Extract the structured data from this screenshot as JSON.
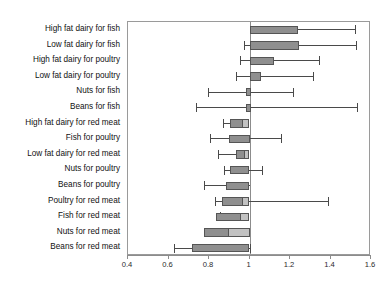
{
  "chart_data": {
    "type": "bar",
    "title": "",
    "subtitle": "",
    "xlabel": "",
    "ylabel": "",
    "xlim": [
      0.4,
      1.6
    ],
    "reference_value": 1.0,
    "grid": false,
    "legend": "none",
    "orientation": "horizontal",
    "xticks": [
      0.4,
      0.6,
      0.8,
      1.0,
      1.2,
      1.4,
      1.6
    ],
    "xticklabels": [
      "0.4",
      "0.6",
      "0.8",
      "1",
      "1.2",
      "1.4",
      "1.6"
    ],
    "categories": [
      "High fat dairy for fish",
      "Low fat dairy for fish",
      "High fat dairy for poultry",
      "Low fat dairy for poultry",
      "Nuts for fish",
      "Beans for fish",
      "High fat dairy for red meat",
      "Fish for poultry",
      "Low fat dairy for red meat",
      "Nuts for poultry",
      "Beans for poultry",
      "Poultry for red meat",
      "Fish for red meat",
      "Nuts for red meat",
      "Beans for red meat"
    ],
    "values": [
      1.24,
      1.245,
      1.12,
      1.055,
      1.005,
      1.005,
      0.935,
      0.93,
      0.985,
      0.945,
      0.985,
      0.985,
      0.915,
      0.885,
      0.795
    ],
    "ci_low": [
      1.0,
      0.975,
      0.955,
      0.935,
      0.795,
      0.735,
      0.87,
      0.805,
      0.845,
      0.875,
      0.775,
      0.83,
      0.855,
      0.815,
      0.625
    ],
    "ci_high": [
      1.52,
      1.525,
      1.345,
      1.315,
      1.215,
      1.53,
      0.995,
      1.155,
      1.0,
      1.06,
      1.0,
      1.39,
      1.0,
      1.0,
      1.0
    ],
    "series": [
      {
        "name": "Hazard ratio with 95% CI",
        "values": [
          1.24,
          1.245,
          1.12,
          1.055,
          1.005,
          1.005,
          0.935,
          0.93,
          0.985,
          0.945,
          0.985,
          0.985,
          0.915,
          0.885,
          0.795
        ]
      }
    ],
    "bars": [
      {
        "label": "High fat dairy for fish",
        "start": 1.0,
        "end": 1.24,
        "inner_end": null,
        "low": 1.0,
        "high": 1.52,
        "cap_low": false,
        "cap_high": true
      },
      {
        "label": "Low fat dairy for fish",
        "start": 1.0,
        "end": 1.245,
        "inner_end": null,
        "low": 0.975,
        "high": 1.525,
        "cap_low": true,
        "cap_high": true
      },
      {
        "label": "High fat dairy for poultry",
        "start": 1.0,
        "end": 1.12,
        "inner_end": null,
        "low": 0.955,
        "high": 1.345,
        "cap_low": true,
        "cap_high": true
      },
      {
        "label": "Low fat dairy for poultry",
        "start": 1.0,
        "end": 1.055,
        "inner_end": null,
        "low": 0.935,
        "high": 1.315,
        "cap_low": true,
        "cap_high": true
      },
      {
        "label": "Nuts for fish",
        "start": 0.985,
        "end": 1.005,
        "inner_end": null,
        "low": 0.795,
        "high": 1.215,
        "cap_low": true,
        "cap_high": true
      },
      {
        "label": "Beans for fish",
        "start": 0.985,
        "end": 1.005,
        "inner_end": null,
        "low": 0.735,
        "high": 1.53,
        "cap_low": true,
        "cap_high": true
      },
      {
        "label": "High fat dairy for red meat",
        "start": 0.905,
        "end": 1.0,
        "inner_end": 0.965,
        "low": 0.87,
        "high": 0.995,
        "cap_low": true,
        "cap_high": true
      },
      {
        "label": "Fish for poultry",
        "start": 0.9,
        "end": 1.0,
        "inner_end": null,
        "low": 0.805,
        "high": 1.155,
        "cap_low": true,
        "cap_high": true
      },
      {
        "label": "Low fat dairy for red meat",
        "start": 0.935,
        "end": 1.0,
        "inner_end": 0.975,
        "low": 0.845,
        "high": 1.0,
        "cap_low": true,
        "cap_high": false
      },
      {
        "label": "Nuts for poultry",
        "start": 0.905,
        "end": 1.0,
        "inner_end": null,
        "low": 0.875,
        "high": 1.06,
        "cap_low": true,
        "cap_high": true
      },
      {
        "label": "Beans for poultry",
        "start": 0.885,
        "end": 1.0,
        "inner_end": null,
        "low": 0.775,
        "high": 1.0,
        "cap_low": true,
        "cap_high": false
      },
      {
        "label": "Poultry for red meat",
        "start": 0.865,
        "end": 1.0,
        "inner_end": 0.965,
        "low": 0.83,
        "high": 1.39,
        "cap_low": true,
        "cap_high": true
      },
      {
        "label": "Fish for red meat",
        "start": 0.835,
        "end": 1.0,
        "inner_end": 0.955,
        "low": 0.855,
        "high": 1.0,
        "cap_low": true,
        "cap_high": false
      },
      {
        "label": "Nuts for red meat",
        "start": 0.775,
        "end": 1.0,
        "inner_end": 0.895,
        "low": 0.815,
        "high": 1.0,
        "cap_low": true,
        "cap_high": false
      },
      {
        "label": "Beans for red meat",
        "start": 0.715,
        "end": 1.0,
        "inner_end": null,
        "low": 0.625,
        "high": 1.0,
        "cap_low": true,
        "cap_high": true
      }
    ],
    "colors": {
      "bar_dark": "#8f8f8f",
      "bar_light": "#c2c2c2",
      "bar_outline": "#555555",
      "whisker": "#4a4a4a",
      "axis": "#8c8c8c",
      "background": "#ffffff"
    }
  }
}
